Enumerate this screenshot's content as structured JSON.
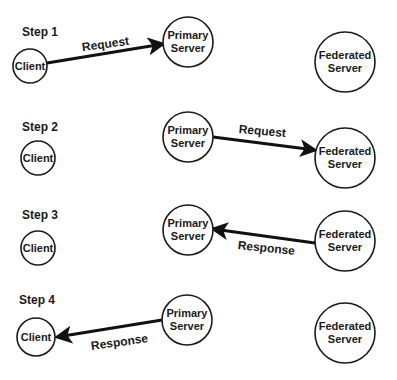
{
  "diagram": {
    "colors": {
      "stroke": "#1a1a1a",
      "background": "#ffffff"
    },
    "steps": [
      {
        "label": "Step 1",
        "label_pos": [
          22,
          36
        ],
        "nodes": [
          {
            "id": "client",
            "lines": [
              "Client"
            ],
            "cx": 30,
            "cy": 66,
            "r": 17,
            "font": 11
          },
          {
            "id": "primary",
            "lines": [
              "Primary",
              "Server"
            ],
            "cx": 188,
            "cy": 42,
            "r": 25,
            "font": 11
          },
          {
            "id": "federated",
            "lines": [
              "Federated",
              "Server"
            ],
            "cx": 345,
            "cy": 62,
            "r": 30,
            "font": 11
          }
        ],
        "edge": {
          "label": "Request",
          "from": [
            47,
            63
          ],
          "to": [
            163,
            44
          ],
          "label_pos": [
            106,
            48
          ],
          "label_rot": -8
        }
      },
      {
        "label": "Step 2",
        "label_pos": [
          22,
          131
        ],
        "nodes": [
          {
            "id": "client",
            "lines": [
              "Client"
            ],
            "cx": 38,
            "cy": 158,
            "r": 17,
            "font": 11
          },
          {
            "id": "primary",
            "lines": [
              "Primary",
              "Server"
            ],
            "cx": 188,
            "cy": 137,
            "r": 25,
            "font": 11
          },
          {
            "id": "federated",
            "lines": [
              "Federated",
              "Server"
            ],
            "cx": 345,
            "cy": 158,
            "r": 30,
            "font": 11
          }
        ],
        "edge": {
          "label": "Request",
          "from": [
            213,
            137
          ],
          "to": [
            315,
            150
          ],
          "label_pos": [
            262,
            135
          ],
          "label_rot": 5
        }
      },
      {
        "label": "Step 3",
        "label_pos": [
          22,
          219
        ],
        "nodes": [
          {
            "id": "client",
            "lines": [
              "Client"
            ],
            "cx": 38,
            "cy": 248,
            "r": 17,
            "font": 11
          },
          {
            "id": "primary",
            "lines": [
              "Primary",
              "Server"
            ],
            "cx": 188,
            "cy": 230,
            "r": 25,
            "font": 11
          },
          {
            "id": "federated",
            "lines": [
              "Federated",
              "Server"
            ],
            "cx": 345,
            "cy": 241,
            "r": 30,
            "font": 11
          }
        ],
        "edge": {
          "label": "Response",
          "from": [
            315,
            243
          ],
          "to": [
            213,
            229
          ],
          "label_pos": [
            266,
            252
          ],
          "label_rot": 6
        }
      },
      {
        "label": "Step 4",
        "label_pos": [
          19,
          304
        ],
        "nodes": [
          {
            "id": "client",
            "lines": [
              "Client"
            ],
            "cx": 36,
            "cy": 337,
            "r": 19,
            "font": 11
          },
          {
            "id": "primary",
            "lines": [
              "Primary",
              "Server"
            ],
            "cx": 187,
            "cy": 320,
            "r": 25,
            "font": 11
          },
          {
            "id": "federated",
            "lines": [
              "Federated",
              "Server"
            ],
            "cx": 345,
            "cy": 333,
            "r": 30,
            "font": 11
          }
        ],
        "edge": {
          "label": "Response",
          "from": [
            162,
            320
          ],
          "to": [
            57,
            337
          ],
          "label_pos": [
            120,
            346
          ],
          "label_rot": -8
        }
      }
    ]
  }
}
